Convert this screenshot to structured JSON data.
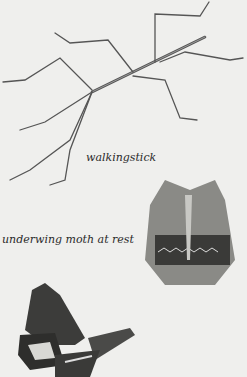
{
  "captions": {
    "walkingstick": "walkingstick",
    "moth_at_rest": "underwing moth at rest"
  },
  "illustrations": [
    {
      "name": "walkingstick",
      "description": "line drawing of a walkingstick insect"
    },
    {
      "name": "underwing moth at rest",
      "description": "stippled drawing of a moth with wings folded"
    },
    {
      "name": "underwing moth open",
      "description": "drawing of a moth with wings spread, showing banded hindwing"
    }
  ],
  "colors": {
    "background": "#efefed",
    "ink": "#2a2a2a"
  }
}
